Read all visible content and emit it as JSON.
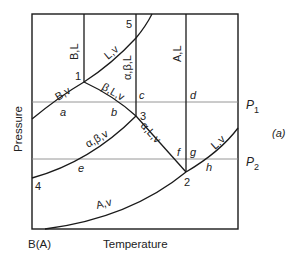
{
  "figure_tag": "(a)",
  "axes": {
    "x_label": "Temperature",
    "y_label": "Pressure",
    "origin_label": "B(A)"
  },
  "isobars": [
    {
      "label": "P",
      "subscript": "1"
    },
    {
      "label": "P",
      "subscript": "2"
    }
  ],
  "invariant_points": [
    "1",
    "2",
    "3",
    "4",
    "5"
  ],
  "region_labels": {
    "B_L": "B,L",
    "L_v_top": "L,v",
    "alpha_beta_L": "α,β,L",
    "A_L": "A,L",
    "B_v": "B,v",
    "beta_L_v": "β,L,v",
    "alpha_beta_v": "α,β,v",
    "alpha_L_v": "α,L,v",
    "L_v_right": "L,v",
    "A_v": "A,v"
  },
  "intersection_labels": [
    "a",
    "b",
    "c",
    "d",
    "e",
    "f",
    "g",
    "h"
  ],
  "colors": {
    "line": "#1a1a1a",
    "isobar": "#8a8a8a",
    "text": "#222222"
  }
}
